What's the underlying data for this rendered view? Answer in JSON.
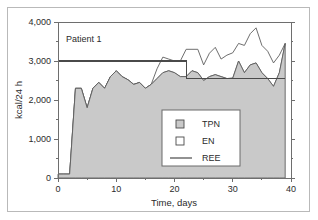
{
  "figure": {
    "annotation": "Patient 1"
  },
  "chart_data": {
    "type": "area",
    "title": "Patient 1",
    "xlabel": "Time, days",
    "ylabel": "kcal/24 h",
    "xlim": [
      0,
      40
    ],
    "ylim": [
      0,
      4000
    ],
    "grid": false,
    "legend_position": "center-right",
    "x_ticks": [
      0,
      10,
      20,
      30,
      40
    ],
    "x_tick_labels": [
      "0",
      "10",
      "20",
      "30",
      "40"
    ],
    "x_minor_ticks": [
      5,
      15,
      25,
      35
    ],
    "y_ticks": [
      0,
      1000,
      2000,
      3000,
      4000
    ],
    "y_tick_labels": [
      "0",
      "1,000",
      "2,000",
      "3,000",
      "4,000"
    ],
    "y_minor_ticks": [
      500,
      1500,
      2500,
      3500
    ],
    "legend": [
      {
        "name": "TPN",
        "marker": "filled-square",
        "color": "#c9c9c9"
      },
      {
        "name": "EN",
        "marker": "open-square",
        "color": "#ffffff"
      },
      {
        "name": "REE",
        "marker": "line",
        "color": "#4a4a4a"
      }
    ],
    "x": [
      0,
      1,
      2,
      3,
      4,
      5,
      6,
      7,
      8,
      9,
      10,
      11,
      12,
      13,
      14,
      15,
      16,
      17,
      18,
      19,
      20,
      21,
      22,
      23,
      24,
      25,
      26,
      27,
      28,
      29,
      30,
      31,
      32,
      33,
      34,
      35,
      36,
      37,
      38,
      39
    ],
    "series": [
      {
        "name": "TPN",
        "stacked": true,
        "values": [
          100,
          100,
          100,
          2300,
          2300,
          1800,
          2300,
          2450,
          2300,
          2600,
          2750,
          2600,
          2520,
          2400,
          2450,
          2300,
          2400,
          2550,
          2700,
          2750,
          2700,
          2600,
          2600,
          2750,
          2700,
          2500,
          2600,
          2650,
          2600,
          2550,
          2560,
          3000,
          2700,
          2900,
          2950,
          2700,
          2550,
          2350,
          2700,
          3450
        ]
      },
      {
        "name": "EN",
        "stacked": true,
        "values": [
          0,
          0,
          0,
          0,
          0,
          0,
          0,
          0,
          0,
          0,
          0,
          0,
          0,
          0,
          0,
          0,
          0,
          250,
          400,
          300,
          300,
          400,
          700,
          550,
          600,
          400,
          600,
          700,
          450,
          600,
          650,
          450,
          700,
          800,
          900,
          700,
          700,
          600,
          450,
          0
        ]
      }
    ],
    "reference_line": {
      "name": "REE",
      "x": [
        0,
        21,
        22,
        39
      ],
      "values": [
        3000,
        3000,
        2550,
        2550
      ]
    }
  }
}
